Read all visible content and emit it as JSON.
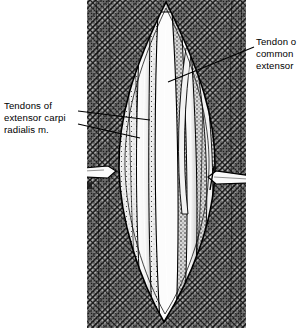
{
  "figure": {
    "kind": "anatomical-surgical-illustration",
    "technique": "pen-and-ink stipple and cross-hatch halftone engraving",
    "palette": {
      "ink": "#000000",
      "paper": "#ffffff",
      "skin_hatch": "#8d8d8d",
      "muscle_mid": "#9a9a9a",
      "tendon_white": "#fbfbfb",
      "shadow": "#2a2a2a"
    },
    "plate_bounds": {
      "left": 87,
      "right": 246,
      "top": 0,
      "bottom": 328
    }
  },
  "labels": [
    {
      "id": "tendons-extensor-carpi-radialis",
      "side": "left",
      "lines": [
        "Tendons of",
        "extensor carpi",
        "radialis m."
      ],
      "x": 4,
      "y": 100,
      "leader_count": 2
    },
    {
      "id": "tendon-common-extensor",
      "side": "right",
      "lines": [
        "Tendon o",
        "common",
        "extensor"
      ],
      "x": 256,
      "y": 36,
      "clipped_at_right_edge": true,
      "leader_count": 1
    }
  ],
  "leaders": [
    {
      "name": "leader-ecr-upper",
      "from": [
        78,
        111
      ],
      "to": [
        150,
        120
      ]
    },
    {
      "name": "leader-ecr-lower",
      "from": [
        78,
        124
      ],
      "to": [
        140,
        138
      ]
    },
    {
      "name": "leader-common-extensor",
      "from": [
        254,
        47
      ],
      "to": [
        168,
        82
      ]
    }
  ],
  "instruments": [
    {
      "name": "retractor-left",
      "blade_x": 112,
      "y": 172,
      "handle_to_x": 60
    },
    {
      "name": "retractor-right",
      "blade_x": 212,
      "y": 178,
      "handle_to_x": 252
    }
  ],
  "wound": {
    "name": "elliptical-incision",
    "apex_top": [
      166,
      2
    ],
    "apex_bottom": [
      164,
      322
    ],
    "widest_y": 165,
    "left_edge_x": 118,
    "right_edge_x": 216
  },
  "structures": [
    {
      "name": "tendon-band-1",
      "note": "white tendon strip, left of midline"
    },
    {
      "name": "tendon-band-2",
      "note": "broad white tendon, midline"
    },
    {
      "name": "tendon-band-3",
      "note": "white tendon strip, right of midline"
    },
    {
      "name": "muscle-belly-left",
      "note": "striated muscle, left wall"
    },
    {
      "name": "muscle-belly-right",
      "note": "striated muscle, right wall"
    },
    {
      "name": "skin-flap-left",
      "note": "cross-hatched skin, left"
    },
    {
      "name": "skin-flap-right",
      "note": "cross-hatched skin, right"
    }
  ]
}
